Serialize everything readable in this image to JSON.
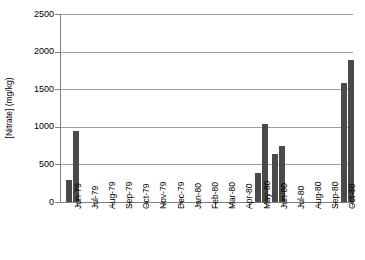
{
  "chart_data": {
    "type": "bar",
    "title": "",
    "xlabel": "",
    "ylabel": "[Nitrate] (mg/kg)",
    "ylim": [
      0,
      2500
    ],
    "yticks": [
      0,
      500,
      1000,
      1500,
      2000,
      2500
    ],
    "ytick_labels": [
      "0",
      "500",
      "1000",
      "1500",
      "2000",
      "2500"
    ],
    "grid": true,
    "legend": false,
    "bar_color": "#4a4a4a",
    "axis_color": "#808080",
    "gridline_color": "#a0a0a0",
    "categories": [
      "Jun-79",
      "Jul-79",
      "Aug-79",
      "Sep-79",
      "Oct-79",
      "Nov-79",
      "Dec-79",
      "Jan-80",
      "Feb-80",
      "Mar-80",
      "Apr-80",
      "May-80",
      "Jun-80",
      "Jul-80",
      "Aug-80",
      "Sep-80",
      "Oct-80"
    ],
    "samples": [
      {
        "category": "Jun-79",
        "value": 290
      },
      {
        "category": "Jun-79",
        "value": 950
      },
      {
        "category": "May-80",
        "value": 390
      },
      {
        "category": "May-80",
        "value": 1040
      },
      {
        "category": "Jun-80",
        "value": 640
      },
      {
        "category": "Jun-80",
        "value": 750
      },
      {
        "category": "Oct-80",
        "value": 1580
      },
      {
        "category": "Oct-80",
        "value": 1890
      }
    ],
    "empty_categories": [
      "Jul-79",
      "Aug-79",
      "Sep-79",
      "Oct-79",
      "Nov-79",
      "Dec-79",
      "Jan-80",
      "Feb-80",
      "Mar-80",
      "Apr-80",
      "Jul-80",
      "Aug-80",
      "Sep-80"
    ]
  }
}
